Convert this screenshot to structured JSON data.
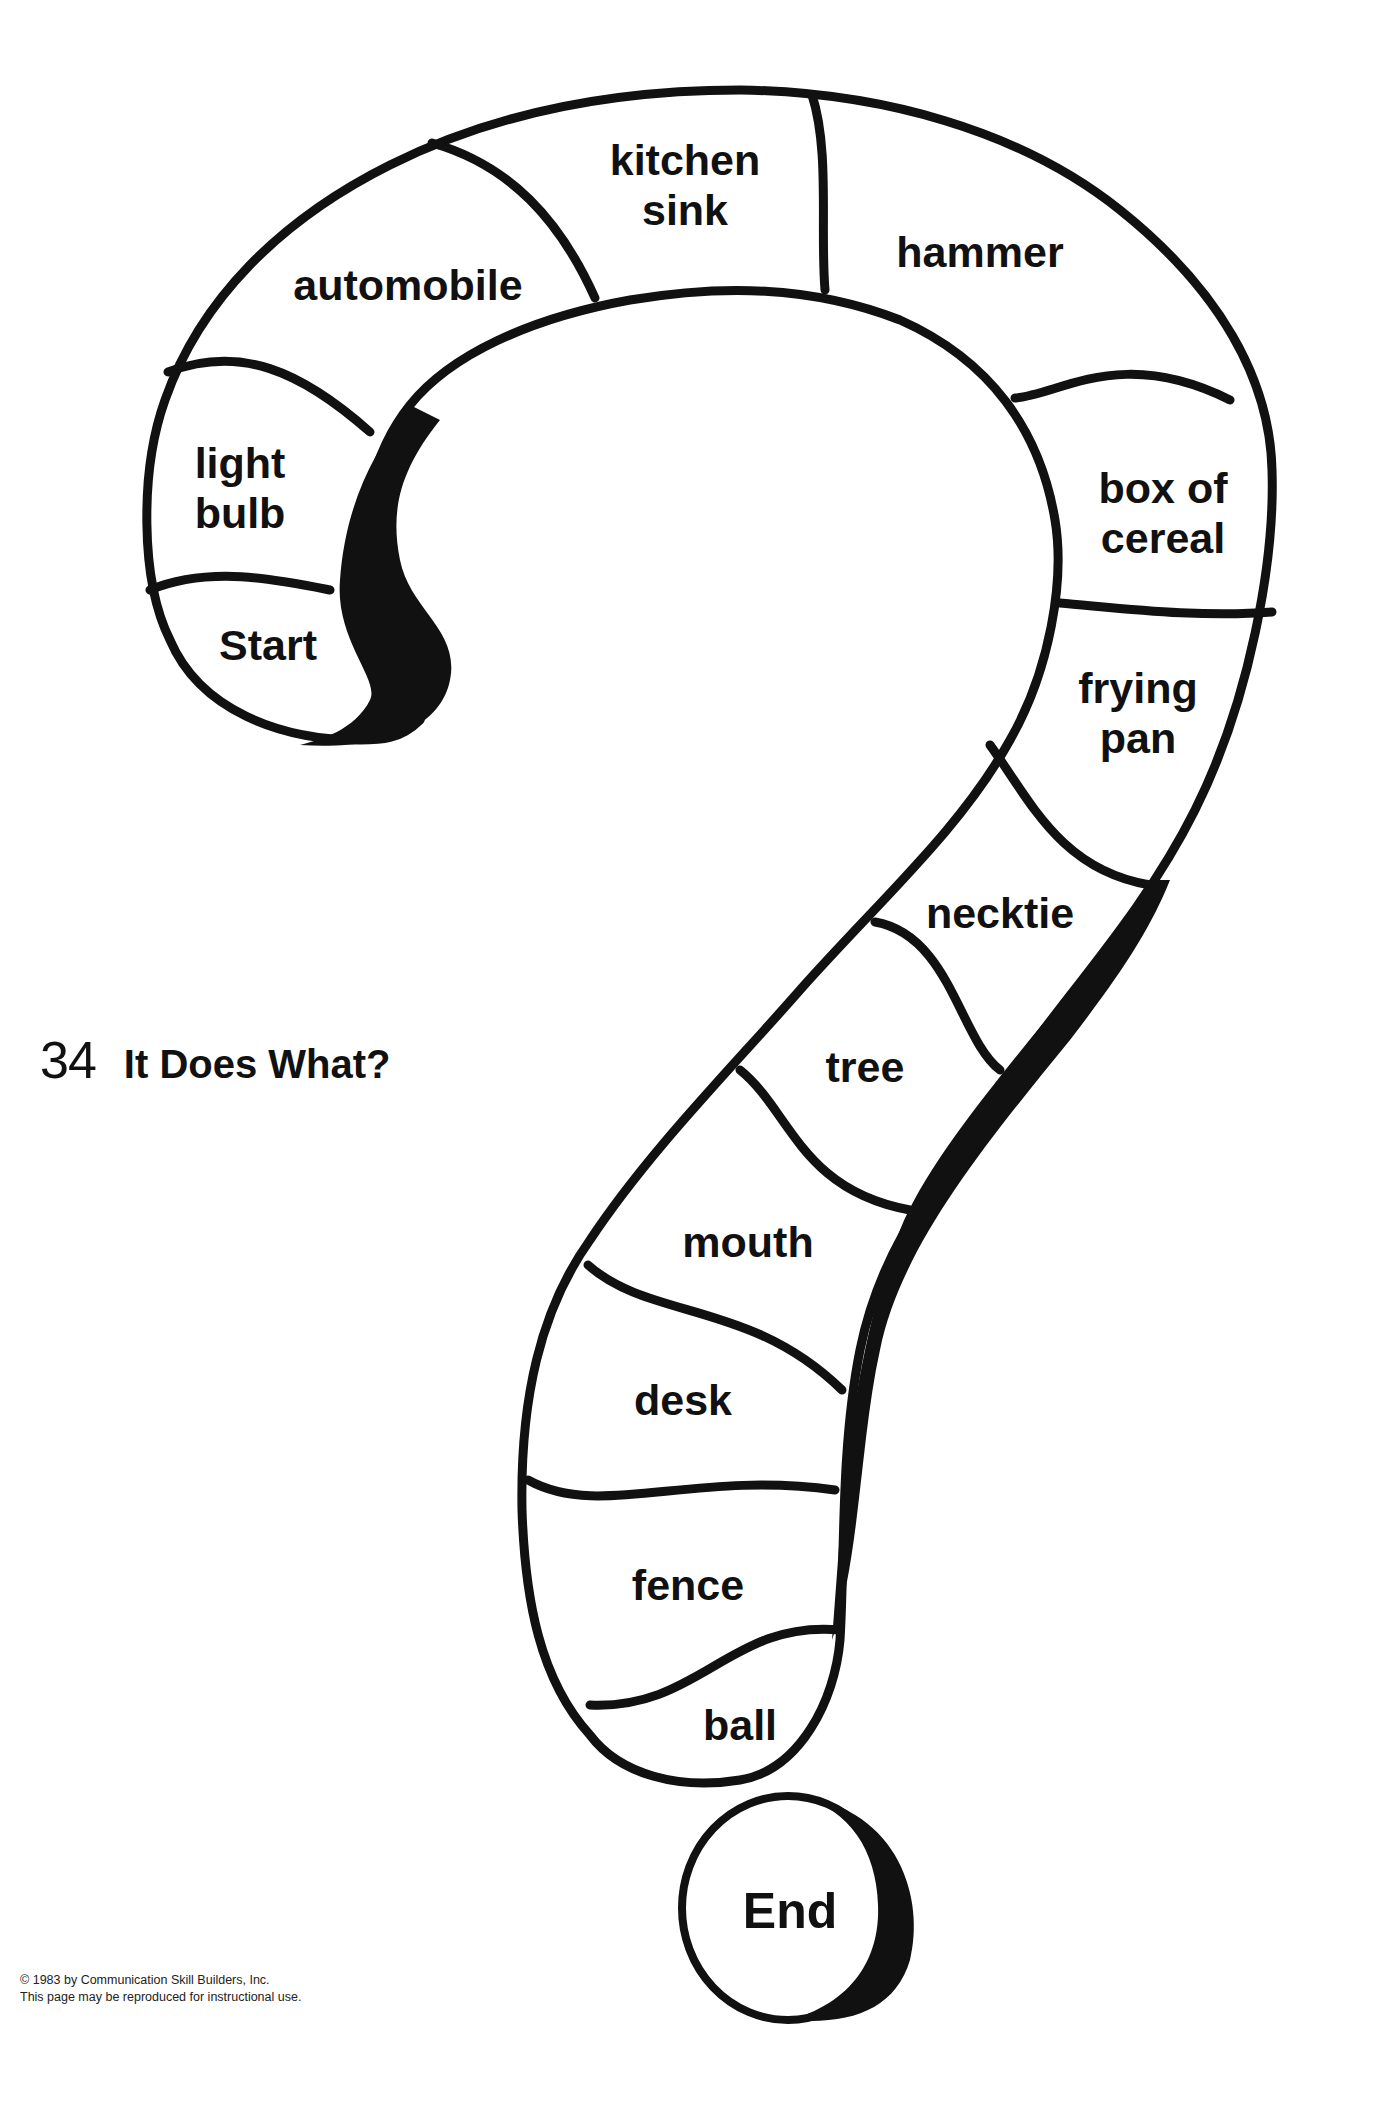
{
  "page": {
    "number": "34",
    "title": "It Does What?"
  },
  "board": {
    "start_label": "Start",
    "end_label": "End",
    "spaces": [
      {
        "label_line1": "light",
        "label_line2": "bulb"
      },
      {
        "label_line1": "automobile",
        "label_line2": ""
      },
      {
        "label_line1": "kitchen",
        "label_line2": "sink"
      },
      {
        "label_line1": "hammer",
        "label_line2": ""
      },
      {
        "label_line1": "box of",
        "label_line2": "cereal"
      },
      {
        "label_line1": "frying",
        "label_line2": "pan"
      },
      {
        "label_line1": "necktie",
        "label_line2": ""
      },
      {
        "label_line1": "tree",
        "label_line2": ""
      },
      {
        "label_line1": "mouth",
        "label_line2": ""
      },
      {
        "label_line1": "desk",
        "label_line2": ""
      },
      {
        "label_line1": "fence",
        "label_line2": ""
      },
      {
        "label_line1": "ball",
        "label_line2": ""
      }
    ],
    "colors": {
      "ink": "#111111",
      "paper": "#ffffff"
    }
  },
  "footer": {
    "copyright": "© 1983 by Communication Skill Builders, Inc.",
    "permission": "This page may be reproduced for instructional use."
  }
}
